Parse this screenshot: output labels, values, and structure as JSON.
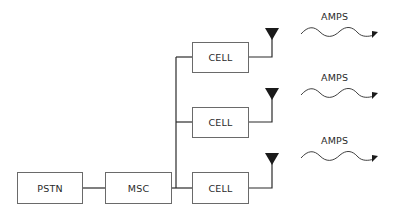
{
  "diagram": {
    "type": "cellular-network-architecture",
    "nodes": {
      "pstn": {
        "label": "PSTN"
      },
      "msc": {
        "label": "MSC"
      },
      "cells": [
        {
          "label": "CELL"
        },
        {
          "label": "CELL"
        },
        {
          "label": "CELL"
        }
      ]
    },
    "signals": [
      {
        "label": "AMPS"
      },
      {
        "label": "AMPS"
      },
      {
        "label": "AMPS"
      }
    ],
    "edges": [
      {
        "from": "PSTN",
        "to": "MSC"
      },
      {
        "from": "MSC",
        "to": "CELL 1"
      },
      {
        "from": "MSC",
        "to": "CELL 2"
      },
      {
        "from": "MSC",
        "to": "CELL 3"
      },
      {
        "from": "CELL 1",
        "to": "antenna 1"
      },
      {
        "from": "CELL 2",
        "to": "antenna 2"
      },
      {
        "from": "CELL 3",
        "to": "antenna 3"
      }
    ],
    "colors": {
      "line": "#2a2a2a",
      "box_border": "#6a6a6a",
      "antenna": "#1a1a1a"
    }
  }
}
